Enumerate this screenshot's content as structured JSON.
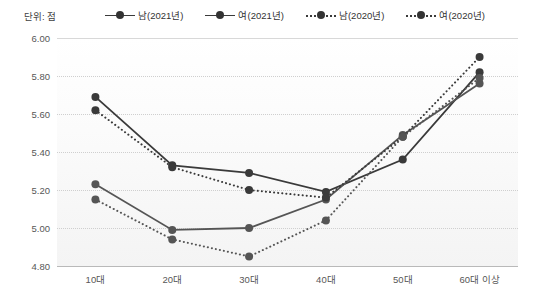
{
  "unit_label": "단위: 점",
  "legend": {
    "items": [
      {
        "label": "남(2021년)",
        "style": "solid",
        "color": "#3a3a3a"
      },
      {
        "label": "여(2021년)",
        "style": "solid",
        "color": "#555555"
      },
      {
        "label": "남(2020년)",
        "style": "dotted",
        "color": "#3a3a3a"
      },
      {
        "label": "여(2020년)",
        "style": "dotted",
        "color": "#555555"
      }
    ]
  },
  "axis": {
    "y_ticks": [
      "6.00",
      "5.80",
      "5.60",
      "5.40",
      "5.20",
      "5.00",
      "4.80"
    ],
    "x_ticks": [
      "10대",
      "20대",
      "30대",
      "40대",
      "50대",
      "60대 이상"
    ]
  },
  "chart_data": {
    "type": "line",
    "title": "",
    "xlabel": "",
    "ylabel": "단위: 점",
    "ylim": [
      4.8,
      6.0
    ],
    "ytick_step": 0.2,
    "grid": true,
    "legend_position": "top",
    "categories": [
      "10대",
      "20대",
      "30대",
      "40대",
      "50대",
      "60대 이상"
    ],
    "series": [
      {
        "name": "남(2021년)",
        "style": "solid",
        "color": "#3a3a3a",
        "values": [
          5.69,
          5.33,
          5.29,
          5.19,
          5.36,
          5.82
        ]
      },
      {
        "name": "여(2021년)",
        "style": "solid",
        "color": "#555555",
        "values": [
          5.23,
          4.99,
          5.0,
          5.15,
          5.49,
          5.76
        ]
      },
      {
        "name": "남(2020년)",
        "style": "dotted",
        "color": "#3a3a3a",
        "values": [
          5.62,
          5.32,
          5.2,
          5.16,
          5.48,
          5.9
        ]
      },
      {
        "name": "여(2020년)",
        "style": "dotted",
        "color": "#555555",
        "values": [
          5.15,
          4.94,
          4.85,
          5.04,
          5.48,
          5.79
        ]
      }
    ]
  }
}
